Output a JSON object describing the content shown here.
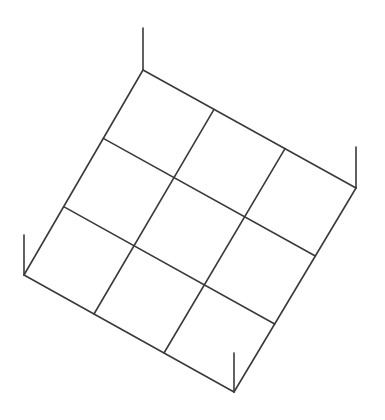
{
  "diagram": {
    "grid": {
      "rows": 3,
      "cols": 3
    },
    "corners": {
      "top": {
        "x": 143,
        "y": 70,
        "post_top_y": 28
      },
      "right": {
        "x": 356,
        "y": 188,
        "post_top_y": 147
      },
      "bottom": {
        "x": 234,
        "y": 392,
        "post_top_y": 353
      },
      "left": {
        "x": 24,
        "y": 275,
        "post_top_y": 235
      }
    },
    "stroke_color": "#3a3a3a",
    "stroke_width": 1.6,
    "background": "#ffffff"
  }
}
